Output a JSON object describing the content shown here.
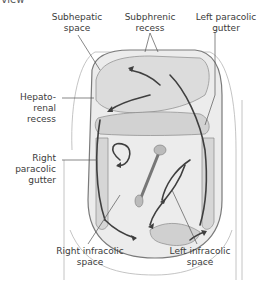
{
  "figure": {
    "clipped_title": "r view",
    "labels": {
      "subhepatic_space": "Subhepatic\nspace",
      "subphrenic_recess": "Subphrenic\nrecess",
      "left_paracolic_gutter": "Left paracolic\ngutter",
      "hepatorenal_recess": "Hepato-\nrenal\nrecess",
      "right_paracolic_gutter": "Right\nparacolic\ngutter",
      "right_infracolic_space": "Right infracolic\nspace",
      "left_infracolic_space": "Left infracolic\nspace"
    },
    "colors": {
      "text": "#3b3b3b",
      "leader_line": "#555555",
      "arrow": "#3f3f3f",
      "organ_fill": "#d9d9d9",
      "body_fill": "#eeeeee",
      "outline": "#8a8a8a"
    }
  }
}
